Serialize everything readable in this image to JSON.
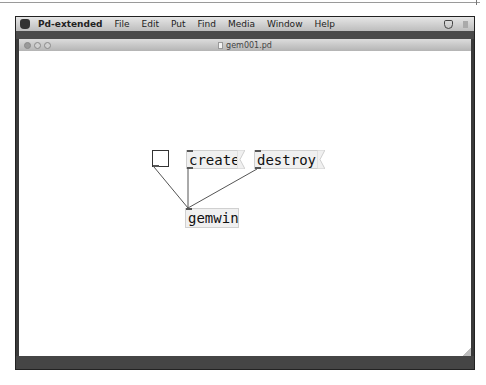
{
  "menubar": {
    "app_name": "Pd-extended",
    "items": [
      "File",
      "Edit",
      "Put",
      "Find",
      "Media",
      "Window",
      "Help"
    ]
  },
  "window": {
    "title": "gem001.pd"
  },
  "patch": {
    "toggle": {
      "state": "off"
    },
    "messages": [
      {
        "label": "create"
      },
      {
        "label": "destroy"
      }
    ],
    "objects": [
      {
        "label": "gemwin"
      }
    ],
    "connections": [
      {
        "from": "toggle",
        "to": "gemwin"
      },
      {
        "from": "create",
        "to": "gemwin"
      },
      {
        "from": "destroy",
        "to": "gemwin"
      }
    ]
  }
}
